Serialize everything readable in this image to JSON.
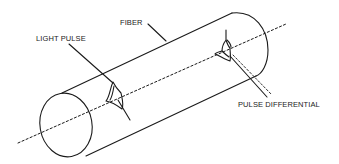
{
  "diagram": {
    "labels": {
      "fiber": "FIBER",
      "light_pulse": "LIGHT PULSE",
      "pulse_differential": "PULSE DIFFERENTIAL"
    },
    "colors": {
      "stroke": "#1a1a1a",
      "background": "#ffffff"
    }
  }
}
